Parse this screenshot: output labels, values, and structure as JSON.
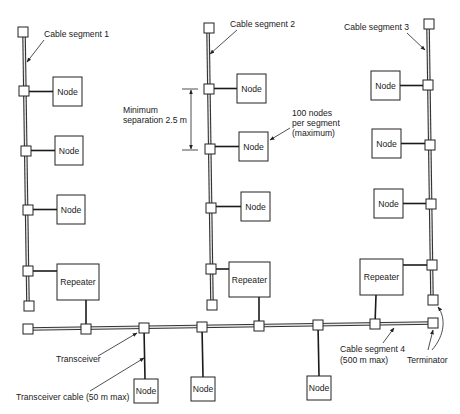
{
  "diagram": {
    "colors": {
      "line": "#222222",
      "background": "#ffffff",
      "cable_core": "#e8e8e8"
    },
    "segments": [
      {
        "id": "seg1",
        "label": "Cable segment 1",
        "label_pos": [
          44,
          37
        ],
        "arrow": {
          "from": [
            44,
            40
          ],
          "to": [
            27,
            62
          ]
        },
        "cable": [
          [
            24,
            33
          ],
          [
            28,
            306
          ]
        ],
        "terminators": [
          [
            18,
            27
          ],
          [
            24,
            301
          ]
        ],
        "transceivers": [
          [
            19,
            86
          ],
          [
            21,
            146
          ],
          [
            23,
            205
          ],
          [
            23,
            266
          ]
        ],
        "devices": [
          {
            "label": "Node",
            "box": [
              53,
              77,
              29,
              29
            ],
            "tap": [
              29,
              91
            ]
          },
          {
            "label": "Node",
            "box": [
              55,
              136,
              28,
              29
            ],
            "tap": [
              31,
              151
            ]
          },
          {
            "label": "Node",
            "box": [
              57,
              195,
              28,
              29
            ],
            "tap": [
              33,
              210
            ]
          },
          {
            "label": "Repeater",
            "box": [
              57,
              264,
              42,
              36
            ],
            "tap": [
              33,
              271
            ]
          }
        ]
      },
      {
        "id": "seg2",
        "label": "Cable segment 2",
        "label_pos": [
          230,
          27
        ],
        "arrow": {
          "from": [
            237,
            30
          ],
          "to": [
            210,
            54
          ]
        },
        "cable": [
          [
            208,
            28
          ],
          [
            212,
            305
          ]
        ],
        "terminators": [
          [
            204,
            23
          ],
          [
            207,
            300
          ]
        ],
        "transceivers": [
          [
            204,
            84
          ],
          [
            205,
            144
          ],
          [
            206,
            203
          ],
          [
            206,
            264
          ]
        ],
        "devices": [
          {
            "label": "Node",
            "box": [
              237,
              74,
              29,
              29
            ],
            "tap": [
              214,
              89
            ]
          },
          {
            "label": "Node",
            "box": [
              239,
              132,
              29,
              29
            ],
            "tap": [
              215,
              149
            ]
          },
          {
            "label": "Node",
            "box": [
              241,
              192,
              29,
              29
            ],
            "tap": [
              216,
              208
            ]
          },
          {
            "label": "Repeater",
            "box": [
              229,
              262,
              41,
              35
            ],
            "tap": [
              216,
              268
            ]
          }
        ]
      },
      {
        "id": "seg3",
        "label": "Cable segment 3",
        "label_pos": [
          344,
          30
        ],
        "arrow": {
          "from": [
            407,
            33
          ],
          "to": [
            425,
            50
          ]
        },
        "cable": [
          [
            428,
            25
          ],
          [
            432,
            300
          ]
        ],
        "terminators": [
          [
            424,
            19
          ],
          [
            428,
            295
          ]
        ],
        "transceivers": [
          [
            423,
            80
          ],
          [
            425,
            140
          ],
          [
            426,
            199
          ],
          [
            427,
            260
          ]
        ],
        "devices": [
          {
            "label": "Node",
            "box": [
              371,
              71,
              29,
              29
            ],
            "tap": [
              423,
              85
            ]
          },
          {
            "label": "Node",
            "box": [
              372,
              129,
              29,
              29
            ],
            "tap": [
              425,
              145
            ]
          },
          {
            "label": "Node",
            "box": [
              374,
              189,
              29,
              29
            ],
            "tap": [
              426,
              204
            ]
          },
          {
            "label": "Repeater",
            "box": [
              360,
              259,
              43,
              36
            ],
            "tap": [
              427,
              265
            ]
          }
        ]
      }
    ],
    "backbone": {
      "id": "seg4",
      "label_line1": "Cable segment 4",
      "label_line2": "(500 m max)",
      "label_pos": [
        340,
        352
      ],
      "arrow": {
        "from": [
          383,
          343
        ],
        "to": [
          394,
          328
        ]
      },
      "cable": [
        [
          28,
          329
        ],
        [
          433,
          323
        ]
      ],
      "terminators": [
        [
          23,
          324
        ],
        [
          428,
          318
        ]
      ],
      "transceivers": [
        {
          "pos": [
            81,
            324
          ],
          "connects": "repeater-seg1",
          "to": [
            86,
            300
          ]
        },
        {
          "pos": [
            139,
            323
          ],
          "connects": "node-bottom-1",
          "to": [
            145,
            379
          ]
        },
        {
          "pos": [
            197,
            322
          ],
          "connects": "node-bottom-2",
          "to": [
            203,
            377
          ]
        },
        {
          "pos": [
            254,
            321
          ],
          "connects": "repeater-seg2",
          "to": [
            259,
            297
          ]
        },
        {
          "pos": [
            313,
            320
          ],
          "connects": "node-bottom-3",
          "to": [
            319,
            376
          ]
        },
        {
          "pos": [
            370,
            319
          ],
          "connects": "repeater-seg3",
          "to": [
            376,
            295
          ]
        }
      ],
      "nodes": [
        {
          "label": "Node",
          "box": [
            134,
            379,
            24,
            24
          ]
        },
        {
          "label": "Node",
          "box": [
            191,
            377,
            24,
            24
          ]
        },
        {
          "label": "Node",
          "box": [
            307,
            376,
            24,
            24
          ]
        }
      ]
    },
    "annotations": {
      "min_sep_line1": "Minimum",
      "min_sep_line2": "separation 2.5 m",
      "min_sep_pos": [
        123,
        113
      ],
      "min_sep_dim": {
        "x": 191,
        "y1": 89,
        "y2": 150,
        "tick_x1": 182,
        "tick_x2": 198
      },
      "max_nodes_line1": "100 nodes",
      "max_nodes_line2": "per segment",
      "max_nodes_line3": "(maximum)",
      "max_nodes_pos": [
        292,
        116
      ],
      "max_nodes_arrow": {
        "from": [
          290,
          128
        ],
        "to": [
          270,
          140
        ]
      },
      "transceiver_label": "Transceiver",
      "transceiver_pos": [
        56,
        362
      ],
      "transceiver_arrow": {
        "from": [
          98,
          356
        ],
        "to": [
          137,
          333
        ]
      },
      "transceiver_cable_label": "Transceiver cable (50 m max)",
      "transceiver_cable_pos": [
        16,
        400
      ],
      "transceiver_cable_arrow": {
        "from": [
          90,
          391
        ],
        "to": [
          144,
          358
        ]
      },
      "terminator_label": "Terminator",
      "terminator_pos": [
        407,
        363
      ],
      "terminator_arrows": [
        {
          "from": [
            428,
            350
          ],
          "to": [
            433,
            330
          ]
        },
        {
          "from": [
            432,
            350
          ],
          "path": "M432,350 C445,335 446,318 438,307"
        }
      ]
    }
  }
}
